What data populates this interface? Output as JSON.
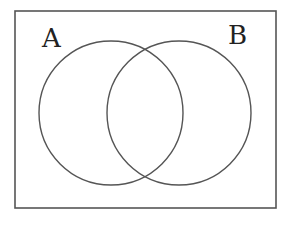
{
  "diagram": {
    "type": "venn",
    "sets": [
      {
        "label": "A",
        "cx": 111,
        "cy": 113,
        "r": 72,
        "label_x": 42,
        "label_y": 47
      },
      {
        "label": "B",
        "cx": 179,
        "cy": 113,
        "r": 72,
        "label_x": 228,
        "label_y": 44
      }
    ],
    "universe": {
      "x": 15,
      "y": 11,
      "width": 261,
      "height": 197
    },
    "stroke_color": "#555555",
    "label_color": "#222222"
  }
}
